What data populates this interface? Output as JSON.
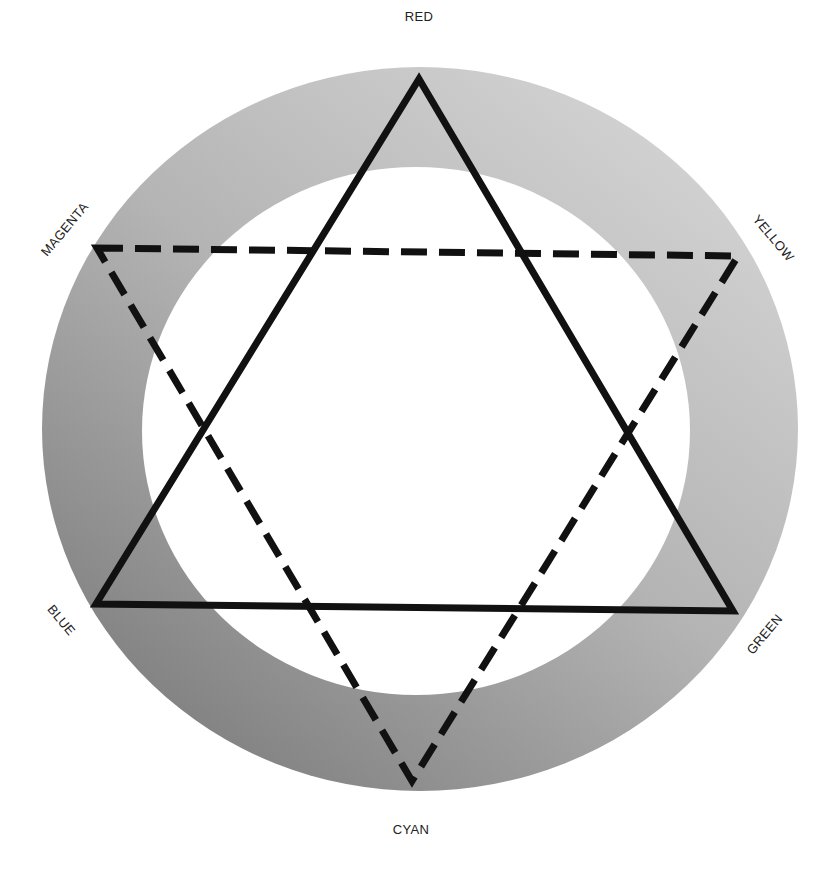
{
  "diagram": {
    "ring": {
      "outer": {
        "cx": 420,
        "cy": 429,
        "rx": 378,
        "ry": 362
      },
      "inner": {
        "cx": 416,
        "cy": 431,
        "rx": 274,
        "ry": 264
      },
      "gradient_light": "#d2d2d2",
      "gradient_mid": "#b4b4b4",
      "gradient_dark": "#848484"
    },
    "solid_triangle": {
      "name": "primary-triangle",
      "stroke": "#111111",
      "vertices": [
        {
          "label": "RED",
          "x": 419,
          "y": 79
        },
        {
          "label": "GREEN",
          "x": 733,
          "y": 611
        },
        {
          "label": "BLUE",
          "x": 96,
          "y": 604
        }
      ]
    },
    "dashed_triangle": {
      "name": "secondary-triangle",
      "stroke": "#111111",
      "vertices": [
        {
          "label": "MAGENTA",
          "x": 97,
          "y": 248
        },
        {
          "label": "YELLOW",
          "x": 738,
          "y": 256
        },
        {
          "label": "CYAN",
          "x": 412,
          "y": 781
        }
      ]
    },
    "labels": {
      "red": "RED",
      "yellow": "YELLOW",
      "green": "GREEN",
      "cyan": "CYAN",
      "blue": "BLUE",
      "magenta": "MAGENTA"
    }
  }
}
